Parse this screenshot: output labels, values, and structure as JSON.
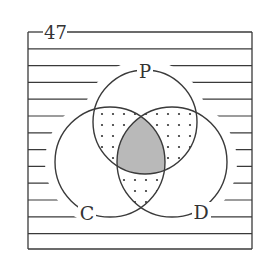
{
  "problem_number": "47",
  "sets": [
    {
      "label": "P",
      "cx": 145,
      "cy": 122,
      "r": 52
    },
    {
      "label": "C",
      "cx": 110,
      "cy": 162,
      "r": 55
    },
    {
      "label": "D",
      "cx": 172,
      "cy": 162,
      "r": 55
    }
  ],
  "regions": {
    "P_and_C_only": "dotted",
    "P_and_D_only": "dotted",
    "C_and_D_only": "dotted",
    "P_and_C_and_D": "gray-shaded",
    "P_only": "blank",
    "C_only": "blank",
    "D_only": "blank",
    "outside": "horizontal-lines"
  },
  "colors": {
    "line": "#3a3a3a",
    "shade": "#b9b9b9",
    "dot": "#333333",
    "background": "#ffffff"
  }
}
